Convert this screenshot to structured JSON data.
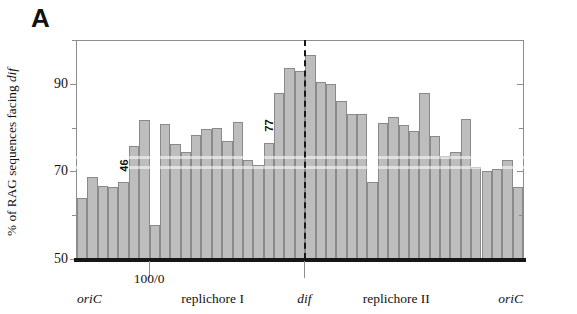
{
  "figure": {
    "panel_letter": "A",
    "y_axis_title_prefix": "% of RAG sequences facing ",
    "y_axis_title_italic": "dif"
  },
  "axes": {
    "y_tick_labels": [
      "90",
      "70",
      "50"
    ],
    "y_major_values": [
      90,
      70,
      50
    ],
    "y_minor_values": [
      100,
      80,
      60
    ],
    "x_labels": [
      {
        "text": "oriC",
        "italic": true,
        "center_pct": 3.0
      },
      {
        "text": "100/0",
        "italic": false,
        "center_pct": 16.3
      },
      {
        "text": "replichore I",
        "italic": false,
        "center_pct": 30.5
      },
      {
        "text": "dif",
        "italic": true,
        "center_pct": 51.0
      },
      {
        "text": "replichore II",
        "italic": false,
        "center_pct": 71.5
      },
      {
        "text": "oriC",
        "italic": true,
        "center_pct": 97.0
      }
    ]
  },
  "annotations": {
    "dif_marker_label": "dif",
    "dif_marker_pct": 51.0,
    "callouts": [
      {
        "text": "46",
        "bar_index": 4
      },
      {
        "text": "77",
        "bar_index": 18
      }
    ]
  },
  "colors": {
    "bar_fill": "#bdbdbd",
    "bar_stroke": "#8a8a8a",
    "axis": "#8d8d8d",
    "baseline": "#161616",
    "dif_line": "#18181c",
    "text": "#121212"
  },
  "chart_data": {
    "type": "bar",
    "title": "A",
    "xlabel": "",
    "ylabel": "% of RAG sequences facing dif",
    "ylim": [
      50,
      100
    ],
    "grid": false,
    "legend": null,
    "x_axis_description": "Genome position, oriC through replichore I, dif, replichore II, back to oriC",
    "categories": [
      "1",
      "2",
      "3",
      "4",
      "5",
      "6",
      "7",
      "8",
      "9",
      "10",
      "11",
      "12",
      "13",
      "14",
      "15",
      "16",
      "17",
      "18",
      "19",
      "20",
      "21",
      "22",
      "23",
      "24",
      "25",
      "26",
      "27",
      "28",
      "29",
      "30",
      "31",
      "32",
      "33",
      "34",
      "35",
      "36",
      "37",
      "38",
      "39",
      "40",
      "41",
      "42",
      "43"
    ],
    "values": [
      64.0,
      68.8,
      66.7,
      66.5,
      67.5,
      75.8,
      81.7,
      57.8,
      80.8,
      76.2,
      74.4,
      78.2,
      79.6,
      79.8,
      77.0,
      81.3,
      72.5,
      71.5,
      76.6,
      88.0,
      93.5,
      93.0,
      96.5,
      90.5,
      90.0,
      86.0,
      83.0,
      83.0,
      67.5,
      81.0,
      82.5,
      80.5,
      79.2,
      88.0,
      78.0,
      73.5,
      74.5,
      82.0,
      71.0,
      70.0,
      70.5,
      72.5,
      66.5
    ]
  }
}
